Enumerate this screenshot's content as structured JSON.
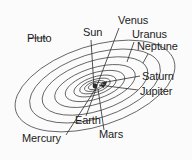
{
  "diagram": {
    "background_color": "#fbfbfb",
    "line_color": "#3a3a3a",
    "text_color": "#1b1b1b",
    "center_label": "Sun",
    "labels": [
      {
        "id": "pluto",
        "text": "Pluto"
      },
      {
        "id": "sun",
        "text": "Sun"
      },
      {
        "id": "venus",
        "text": "Venus"
      },
      {
        "id": "uranus",
        "text": "Uranus"
      },
      {
        "id": "neptune",
        "text": "Neptune"
      },
      {
        "id": "saturn",
        "text": "Saturn"
      },
      {
        "id": "jupiter",
        "text": "Jupiter"
      },
      {
        "id": "earth",
        "text": "Earth"
      },
      {
        "id": "mars",
        "text": "Mars"
      },
      {
        "id": "mercury",
        "text": "Mercury"
      }
    ],
    "orbit_count": 9
  }
}
